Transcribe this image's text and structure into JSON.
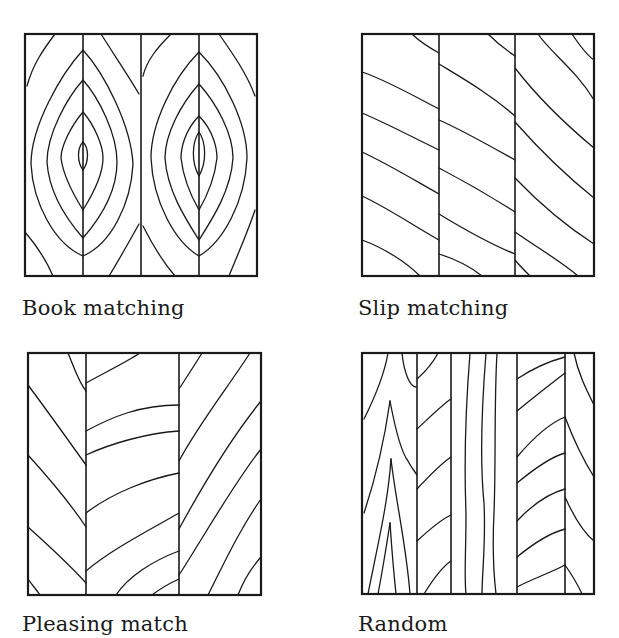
{
  "figure": {
    "stroke_color": "#1a1a1a",
    "background_color": "#ffffff"
  },
  "panels": [
    {
      "id": "book",
      "label": "Book matching",
      "leaves": 4,
      "pattern": "mirrored concentric ellipses"
    },
    {
      "id": "slip",
      "label": "Slip matching",
      "leaves": 3,
      "pattern": "repeated parallel diagonals"
    },
    {
      "id": "pleasing",
      "label": "Pleasing match",
      "leaves": 3,
      "pattern": "similar grain, varied direction"
    },
    {
      "id": "random",
      "label": "Random",
      "leaves": 5,
      "pattern": "unmatched mixed grain"
    }
  ]
}
